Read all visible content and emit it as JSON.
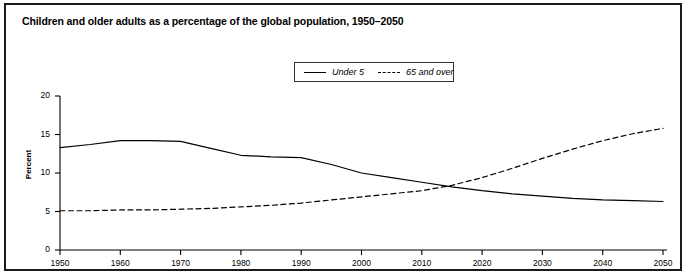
{
  "figure": {
    "title": "Children and older adults as a percentage of the global population, 1950–2050"
  },
  "legend": {
    "position": "top-center",
    "entries": [
      {
        "label": "Under 5",
        "style": "solid",
        "icon": "solid-line-swatch"
      },
      {
        "label": "65 and over",
        "style": "dashed",
        "icon": "dashed-line-swatch"
      }
    ]
  },
  "axes": {
    "y_title": "Percent",
    "y_ticks": [
      "0",
      "5",
      "10",
      "15",
      "20"
    ],
    "x_ticks": [
      "1950",
      "1960",
      "1970",
      "1980",
      "1990",
      "2000",
      "2010",
      "2020",
      "2030",
      "2040",
      "2050"
    ]
  },
  "colors": {
    "line": "#000000",
    "frame": "#1a1a1a",
    "background": "#ffffff"
  },
  "chart_data": {
    "type": "line",
    "title": "Children and older adults as a percentage of the global population, 1950–2050",
    "xlabel": "",
    "ylabel": "Percent",
    "xlim": [
      1950,
      2050
    ],
    "ylim": [
      0,
      20
    ],
    "yticks": [
      0,
      5,
      10,
      15,
      20
    ],
    "xticks": [
      1950,
      1960,
      1970,
      1980,
      1990,
      2000,
      2010,
      2020,
      2030,
      2040,
      2050
    ],
    "grid": false,
    "legend_position": "top-center",
    "x": [
      1950,
      1955,
      1960,
      1965,
      1970,
      1975,
      1980,
      1985,
      1990,
      1995,
      2000,
      2005,
      2010,
      2015,
      2020,
      2025,
      2030,
      2035,
      2040,
      2045,
      2050
    ],
    "series": [
      {
        "name": "Under 5",
        "style": "solid",
        "values": [
          13.3,
          13.7,
          14.2,
          14.2,
          14.1,
          13.2,
          12.3,
          12.1,
          12.0,
          11.1,
          10.0,
          9.4,
          8.8,
          8.2,
          7.7,
          7.3,
          7.0,
          6.7,
          6.5,
          6.4,
          6.3
        ]
      },
      {
        "name": "65 and over",
        "style": "dashed",
        "values": [
          5.1,
          5.1,
          5.2,
          5.2,
          5.3,
          5.4,
          5.6,
          5.8,
          6.1,
          6.5,
          6.9,
          7.3,
          7.7,
          8.4,
          9.4,
          10.6,
          11.9,
          13.1,
          14.2,
          15.1,
          15.8
        ]
      }
    ],
    "annotations": [
      {
        "text": "crossover",
        "x": 2017,
        "y": 8.4
      }
    ]
  }
}
